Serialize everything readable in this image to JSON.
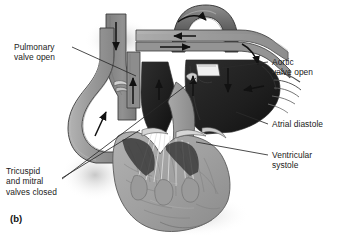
{
  "figure": {
    "caption": "(b)",
    "labels": {
      "pulmonary_valve": "Pulmonary\nvalve open",
      "tricuspid_mitral": "Tricuspid\nand mitral\nvalves closed",
      "aortic_valve": "Aortic\nvalve open",
      "atrial_diastole": "Atrial diastole",
      "ventricular_systole": "Ventricular\nsystole"
    },
    "colors": {
      "background": "#ffffff",
      "text": "#1a1a1a",
      "leader_line": "#2b2b2b",
      "vessel_wall": "#9a9a9a",
      "vessel_lumen": "#8a8a8a",
      "chamber_dark": "#232323",
      "chamber_mid": "#4a4a4a",
      "myocardium": "#a3a3a3",
      "myocardium_shade": "#8d8d8d",
      "valve_light": "#cfcfcf",
      "highlight": "#f2f2f2",
      "outline": "#3a3a3a",
      "arrow": "#111111"
    },
    "flow_arrows": [
      {
        "name": "aortic-arch-flow",
        "direction": "right"
      },
      {
        "name": "brachiocephalic-flow",
        "direction": "left"
      },
      {
        "name": "aortic-arch-top-flow",
        "direction": "right"
      },
      {
        "name": "superior-vena-cava-inflow",
        "direction": "down"
      },
      {
        "name": "pulmonary-trunk-outflow",
        "direction": "up"
      },
      {
        "name": "pulmonary-artery-outflow",
        "direction": "up"
      },
      {
        "name": "right-ventricle-outflow",
        "direction": "up"
      },
      {
        "name": "aortic-outflow",
        "direction": "up"
      },
      {
        "name": "left-atrium-inflow",
        "direction": "down"
      },
      {
        "name": "pulmonary-vein-inflow",
        "direction": "left"
      }
    ]
  }
}
